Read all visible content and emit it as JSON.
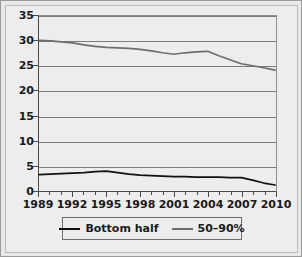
{
  "chart_data": {
    "type": "line",
    "title": "",
    "xlabel": "",
    "ylabel": "",
    "xlim": [
      1989,
      2010
    ],
    "ylim": [
      0,
      35
    ],
    "ytick_step": 5,
    "grid": true,
    "legend_position": "bottom",
    "x": [
      1989,
      1990,
      1991,
      1992,
      1993,
      1994,
      1995,
      1996,
      1997,
      1998,
      1999,
      2000,
      2001,
      2002,
      2003,
      2004,
      2005,
      2006,
      2007,
      2008,
      2009,
      2010
    ],
    "xticks_major": [
      1989,
      1992,
      1995,
      1998,
      2001,
      2004,
      2007,
      2010
    ],
    "xtick_labels": [
      "1989",
      "1992",
      "1995",
      "1998",
      "2001",
      "2004",
      "2007",
      "2010"
    ],
    "yticks": [
      0,
      5,
      10,
      15,
      20,
      25,
      30,
      35
    ],
    "ytick_labels": [
      "0",
      "5",
      "10",
      "15",
      "20",
      "25",
      "30",
      "35"
    ],
    "series": [
      {
        "name": "Bottom half",
        "color": "#111111",
        "values": [
          3.1,
          3.2,
          3.3,
          3.4,
          3.5,
          3.7,
          3.8,
          3.5,
          3.2,
          3.0,
          2.9,
          2.8,
          2.7,
          2.7,
          2.6,
          2.6,
          2.6,
          2.5,
          2.5,
          2.0,
          1.4,
          1.0
        ]
      },
      {
        "name": "50–90%",
        "color": "#6d6d6d",
        "values": [
          30.1,
          30.0,
          29.8,
          29.6,
          29.2,
          28.9,
          28.7,
          28.6,
          28.5,
          28.3,
          28.0,
          27.6,
          27.3,
          27.6,
          27.8,
          27.9,
          27.0,
          26.2,
          25.4,
          25.0,
          24.6,
          24.1
        ]
      }
    ]
  },
  "legend": {
    "entries": [
      {
        "label": "Bottom half",
        "swatch": "black-line"
      },
      {
        "label": "50–90%",
        "swatch": "gray-line"
      }
    ]
  },
  "colors": {
    "background": "#ededed",
    "frame": "#9a9a9a",
    "gridline": "#7d7d7d",
    "axis": "#4a4a4a",
    "series_bottom_half": "#111111",
    "series_mid": "#6d6d6d",
    "text": "#1a1a1a"
  }
}
